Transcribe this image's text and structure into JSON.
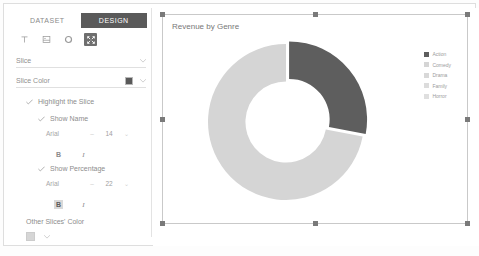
{
  "sidebar": {
    "tabs": [
      {
        "label": "DATASET",
        "active": false
      },
      {
        "label": "DESIGN",
        "active": true
      }
    ],
    "toolbar": [
      {
        "name": "text-tool",
        "selected": false
      },
      {
        "name": "image-tool",
        "selected": false
      },
      {
        "name": "shape-tool",
        "selected": false
      },
      {
        "name": "resize-tool",
        "selected": true
      }
    ],
    "slice_field": {
      "label": "Slice"
    },
    "slice_color": {
      "label": "Slice Color",
      "color": "#595959"
    },
    "highlight_slice": {
      "label": "Highlight the Slice",
      "checked": true
    },
    "show_name": {
      "label": "Show Name",
      "checked": true,
      "font": "Arial",
      "size": "14",
      "bold_active": false,
      "italic_active": false,
      "bold_label": "B",
      "italic_label": "I"
    },
    "show_percentage": {
      "label": "Show Percentage",
      "checked": true,
      "font": "Arial",
      "size": "22",
      "bold_active": true,
      "italic_active": false,
      "bold_label": "B",
      "italic_label": "I"
    },
    "other_slices_color": {
      "label": "Other Slices' Color",
      "color": "#d6d6d6"
    }
  },
  "chart_data": {
    "type": "pie",
    "title": "Revenue by Genre",
    "donut": true,
    "inner_radius_ratio": 0.52,
    "categories": [
      "Action",
      "Comedy",
      "Drama",
      "Family",
      "Horror"
    ],
    "values": [
      28,
      72,
      0,
      0,
      0
    ],
    "highlight_index": 0,
    "colors": [
      "#5e5e5e",
      "#d5d5d5",
      "#d5d5d5",
      "#d5d5d5",
      "#d5d5d5"
    ],
    "legend": {
      "position": "right",
      "entries": [
        {
          "label": "Action",
          "color": "#5e5e5e"
        },
        {
          "label": "Comedy",
          "color": "#d5d5d5"
        },
        {
          "label": "Drama",
          "color": "#d8d8d8"
        },
        {
          "label": "Family",
          "color": "#dcdcdc"
        },
        {
          "label": "Horror",
          "color": "#dfdfdf"
        }
      ]
    },
    "xlabel": "",
    "ylabel": "",
    "grid": false
  }
}
